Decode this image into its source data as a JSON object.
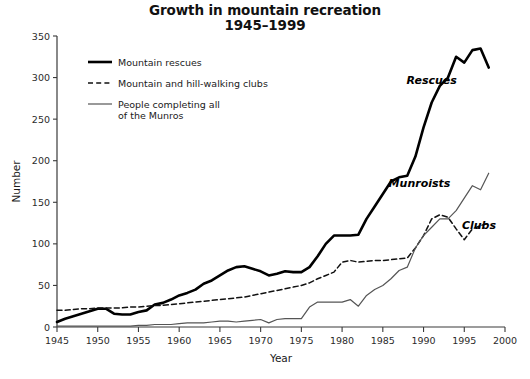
{
  "chart_data": {
    "type": "line",
    "title": "Growth in mountain recreation",
    "subtitle": "1945–1999",
    "xlabel": "Year",
    "ylabel": "Number",
    "xlim": [
      1945,
      2000
    ],
    "ylim": [
      0,
      350
    ],
    "xticks": [
      1945,
      1950,
      1955,
      1960,
      1965,
      1970,
      1975,
      1980,
      1985,
      1990,
      1995,
      2000
    ],
    "yticks": [
      0,
      50,
      100,
      150,
      200,
      250,
      300,
      350
    ],
    "grid": false,
    "legend_position": "upper-left-inside",
    "annotations": [
      {
        "text": "Rescues",
        "x": 1991.0,
        "y": 292
      },
      {
        "text": "Munroists",
        "x": 1989.5,
        "y": 168
      },
      {
        "text": "Clubs",
        "x": 1996.8,
        "y": 118
      }
    ],
    "legend": [
      {
        "label": "Mountain rescues",
        "style": "solid-thick",
        "color": "#000000"
      },
      {
        "label": "Mountain and hill-walking clubs",
        "style": "dashed",
        "color": "#111111"
      },
      {
        "label": "People completing all\nof the Munros",
        "style": "solid-thin",
        "color": "#555555"
      }
    ],
    "series": [
      {
        "name": "Mountain rescues",
        "style": "solid-thick",
        "color": "#000000",
        "x": [
          1945,
          1946,
          1947,
          1948,
          1949,
          1950,
          1951,
          1952,
          1953,
          1954,
          1955,
          1956,
          1957,
          1958,
          1959,
          1960,
          1961,
          1962,
          1963,
          1964,
          1965,
          1966,
          1967,
          1968,
          1969,
          1970,
          1971,
          1972,
          1973,
          1974,
          1975,
          1976,
          1977,
          1978,
          1979,
          1980,
          1981,
          1982,
          1983,
          1984,
          1985,
          1986,
          1987,
          1988,
          1989,
          1990,
          1991,
          1992,
          1993,
          1994,
          1995,
          1996,
          1997,
          1998
        ],
        "values": [
          6,
          10,
          13,
          16,
          19,
          22,
          22,
          16,
          15,
          15,
          18,
          20,
          27,
          29,
          33,
          38,
          41,
          45,
          52,
          56,
          62,
          68,
          72,
          73,
          70,
          67,
          62,
          64,
          67,
          66,
          66,
          72,
          85,
          100,
          110,
          110,
          110,
          111,
          130,
          145,
          160,
          175,
          180,
          182,
          205,
          240,
          270,
          290,
          300,
          325,
          318,
          333,
          335,
          312
        ]
      },
      {
        "name": "Mountain and hill-walking clubs",
        "style": "dashed",
        "color": "#111111",
        "x": [
          1945,
          1946,
          1947,
          1948,
          1949,
          1950,
          1951,
          1952,
          1953,
          1954,
          1955,
          1956,
          1957,
          1958,
          1959,
          1960,
          1961,
          1962,
          1963,
          1964,
          1965,
          1966,
          1967,
          1968,
          1969,
          1970,
          1971,
          1972,
          1973,
          1974,
          1975,
          1976,
          1977,
          1978,
          1979,
          1980,
          1981,
          1982,
          1983,
          1984,
          1985,
          1986,
          1987,
          1988,
          1989,
          1990,
          1991,
          1992,
          1993,
          1994,
          1995,
          1996,
          1997,
          1998
        ],
        "values": [
          20,
          20,
          21,
          22,
          22,
          23,
          23,
          23,
          23,
          24,
          24,
          25,
          26,
          26,
          27,
          28,
          29,
          30,
          31,
          32,
          33,
          34,
          35,
          36,
          38,
          40,
          42,
          44,
          46,
          48,
          50,
          53,
          58,
          62,
          66,
          78,
          80,
          78,
          79,
          80,
          80,
          81,
          82,
          83,
          95,
          110,
          130,
          135,
          132,
          118,
          105,
          118,
          122,
          125
        ]
      },
      {
        "name": "People completing all of the Munros",
        "style": "solid-thin",
        "color": "#555555",
        "x": [
          1945,
          1946,
          1947,
          1948,
          1949,
          1950,
          1951,
          1952,
          1953,
          1954,
          1955,
          1956,
          1957,
          1958,
          1959,
          1960,
          1961,
          1962,
          1963,
          1964,
          1965,
          1966,
          1967,
          1968,
          1969,
          1970,
          1971,
          1972,
          1973,
          1974,
          1975,
          1976,
          1977,
          1978,
          1979,
          1980,
          1981,
          1982,
          1983,
          1984,
          1985,
          1986,
          1987,
          1988,
          1989,
          1990,
          1991,
          1992,
          1993,
          1994,
          1995,
          1996,
          1997,
          1998
        ],
        "values": [
          1,
          1,
          1,
          1,
          1,
          1,
          1,
          1,
          1,
          1,
          2,
          2,
          3,
          3,
          3,
          4,
          5,
          5,
          5,
          6,
          7,
          7,
          6,
          7,
          8,
          9,
          5,
          9,
          10,
          10,
          10,
          24,
          30,
          30,
          30,
          30,
          33,
          25,
          38,
          45,
          50,
          58,
          68,
          72,
          95,
          110,
          120,
          130,
          130,
          140,
          155,
          170,
          165,
          185
        ]
      }
    ]
  }
}
